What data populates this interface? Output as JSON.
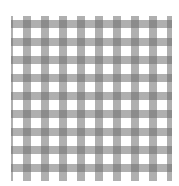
{
  "image": {
    "subject": "gray and white gingham check pattern",
    "pattern": {
      "type": "gingham",
      "period_px": 18,
      "band_width_px": 8,
      "colors": {
        "background": "#ffffff",
        "band": "#b8b8b8",
        "intersection": "#8a8a8a"
      }
    }
  }
}
